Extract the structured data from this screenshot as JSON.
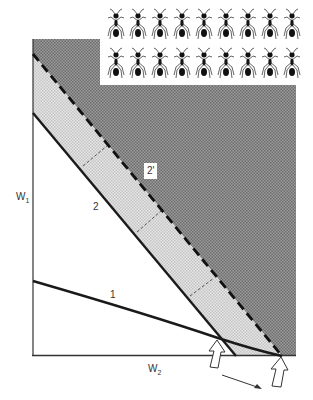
{
  "figure": {
    "type": "diagram",
    "axes": {
      "y_label": "W",
      "y_label_sub": "1",
      "x_label": "W",
      "x_label_sub": "2"
    },
    "lines": [
      {
        "id": "1",
        "label": "1",
        "style": "solid",
        "description": "low, curved line"
      },
      {
        "id": "2",
        "label": "2",
        "style": "solid",
        "description": "steep line"
      },
      {
        "id": "2prime",
        "label": "2'",
        "style": "dashed",
        "description": "shifted steep line"
      }
    ],
    "regions": {
      "dark": {
        "color": "#8a8a8a",
        "pattern": "dense halftone"
      },
      "band": {
        "color": "#dcdcdc",
        "pattern": "light halftone",
        "between": [
          "2",
          "2'"
        ]
      }
    },
    "annotations": {
      "arrow_1": "hollow up arrow at intersection of line 1 and line 2",
      "arrow_2": "hollow up arrow at intersection of line 1 and line 2' on x-axis",
      "shift_arrow": "thin arrow pointing from first to second position"
    },
    "ant_rows": 2,
    "ants_per_row": 9,
    "colors": {
      "line": "#1a1a1a",
      "dark_fill": "#8c8c8c",
      "band_fill": "#dadada",
      "background": "#ffffff"
    }
  }
}
